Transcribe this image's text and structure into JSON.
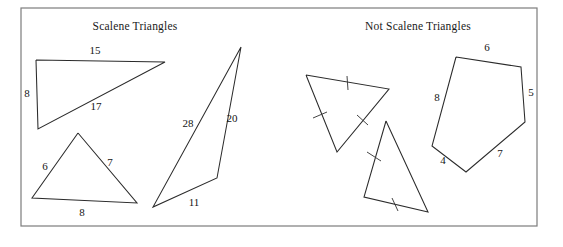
{
  "figure": {
    "width": 563,
    "height": 247,
    "background_color": "#ffffff",
    "frame": {
      "name": "outer-border",
      "x": 21,
      "y": 8,
      "width": 516,
      "height": 218,
      "stroke_color": "#7c7c7c"
    },
    "panels": [
      {
        "id": "scalene",
        "title": "Scalene Triangles",
        "title_x": 135,
        "title_y": 30
      },
      {
        "id": "not-scalene",
        "title": "Not Scalene Triangles",
        "title_x": 418,
        "title_y": 30
      }
    ],
    "shapes": [
      {
        "id": "right-triangle",
        "name": "scalene-right-triangle",
        "panel": "scalene",
        "points": "36,60 165,62 38,129 36,60",
        "closed": true,
        "stroke_color": "#2b2b2b",
        "labels": [
          {
            "text": "15",
            "x": 95,
            "y": 54
          },
          {
            "text": "8",
            "x": 27,
            "y": 97
          },
          {
            "text": "17",
            "x": 96,
            "y": 110
          }
        ],
        "ticks": []
      },
      {
        "id": "acute-triangle",
        "name": "scalene-acute-triangle",
        "panel": "scalene",
        "points": "78,133 137,203 32,198 78,133",
        "closed": true,
        "stroke_color": "#2b2b2b",
        "labels": [
          {
            "text": "6",
            "x": 45,
            "y": 170
          },
          {
            "text": "7",
            "x": 110,
            "y": 166
          },
          {
            "text": "8",
            "x": 82,
            "y": 216
          }
        ],
        "ticks": []
      },
      {
        "id": "obtuse-thin-triangle",
        "name": "scalene-thin-triangle",
        "panel": "scalene",
        "points": "241,47 217,178 153,207 241,47",
        "closed": true,
        "stroke_color": "#2b2b2b",
        "labels": [
          {
            "text": "28",
            "x": 188,
            "y": 127
          },
          {
            "text": "20",
            "x": 232,
            "y": 122
          },
          {
            "text": "11",
            "x": 194,
            "y": 206
          }
        ],
        "ticks": []
      },
      {
        "id": "equilateral-triangle",
        "name": "not-scalene-equilateral-triangle",
        "panel": "not-scalene",
        "points": "306,75 389,89 337,152 306,75",
        "closed": true,
        "stroke_color": "#2b2b2b",
        "labels": [],
        "ticks": [
          {
            "x1": 347,
            "y1": 76,
            "x2": 348,
            "y2": 90
          },
          {
            "x1": 357,
            "y1": 115,
            "x2": 368,
            "y2": 125
          },
          {
            "x1": 313,
            "y1": 118,
            "x2": 327,
            "y2": 112
          }
        ]
      },
      {
        "id": "isosceles-triangle",
        "name": "not-scalene-isosceles-triangle",
        "panel": "not-scalene",
        "points": "386,121 428,212 364,197 386,121",
        "closed": true,
        "stroke_color": "#2b2b2b",
        "labels": [],
        "ticks": [
          {
            "x1": 367,
            "y1": 152,
            "x2": 381,
            "y2": 161
          },
          {
            "x1": 392,
            "y1": 198,
            "x2": 398,
            "y2": 211
          }
        ]
      },
      {
        "id": "pentagon",
        "name": "not-scalene-pentagon",
        "panel": "not-scalene",
        "points": "456,57 521,67 525,122 466,172 432,146 456,57",
        "closed": true,
        "stroke_color": "#2b2b2b",
        "labels": [
          {
            "text": "6",
            "x": 487,
            "y": 51
          },
          {
            "text": "5",
            "x": 531,
            "y": 96
          },
          {
            "text": "8",
            "x": 437,
            "y": 101
          },
          {
            "text": "4",
            "x": 443,
            "y": 164
          },
          {
            "text": "7",
            "x": 500,
            "y": 157
          }
        ],
        "ticks": []
      }
    ]
  }
}
